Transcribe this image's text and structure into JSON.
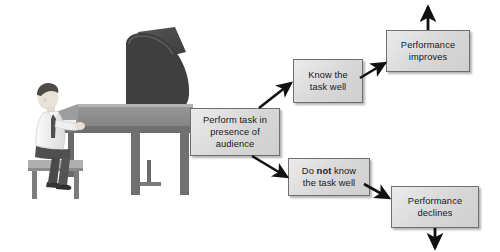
{
  "diagram": {
    "background_color": "#ffffff",
    "boxes": [
      {
        "id": "perform",
        "label": "Perform task in presence of audience",
        "lines": [
          "Perform task in",
          "presence of",
          "audience"
        ]
      },
      {
        "id": "know",
        "label": "Know the task well",
        "lines": [
          "Know the",
          "task well"
        ]
      },
      {
        "id": "notknow",
        "label": "Do not know the task well",
        "lines": [
          "Do not know",
          "the task well"
        ],
        "emphasis": "not"
      },
      {
        "id": "improves",
        "label": "Performance improves",
        "lines": [
          "Performance",
          "improves"
        ]
      },
      {
        "id": "declines",
        "label": "Performance declines",
        "lines": [
          "Performance",
          "declines"
        ]
      }
    ],
    "connections": [
      {
        "from": "perform",
        "to": "know",
        "style": "arrow-up-right"
      },
      {
        "from": "perform",
        "to": "notknow",
        "style": "arrow-down-right"
      },
      {
        "from": "know",
        "to": "improves",
        "style": "arrow-up-right"
      },
      {
        "from": "notknow",
        "to": "declines",
        "style": "arrow-down-right"
      },
      {
        "from": "improves",
        "to": "up",
        "style": "arrow-up"
      },
      {
        "from": "declines",
        "to": "down",
        "style": "arrow-down"
      }
    ],
    "illustration": {
      "name": "pianist-at-grand-piano",
      "subject": "man playing grand piano on bench",
      "shirt_color": "#f2f2f2",
      "tie_color": "#4c4c4c",
      "trousers_color": "#4f4f4f",
      "piano_body_color": "#8d8d8d",
      "piano_lid_color": "#4a4a4a",
      "bench_color": "#a6a6a6"
    },
    "colors": {
      "box_fill": "#d9d9d9",
      "box_border": "#6f6f6f",
      "text": "#17181a",
      "arrow": "#111111"
    }
  }
}
